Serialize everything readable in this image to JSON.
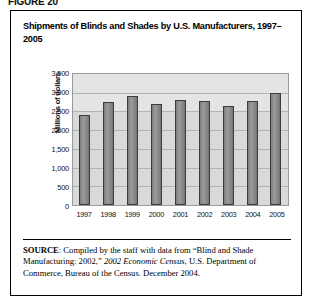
{
  "figure": {
    "label": "FIGURE 20",
    "title": "Shipments of Blinds and Shades by U.S. Manufacturers, 1997–2005"
  },
  "source": {
    "prefix": "SOURCE",
    "text_before_italic": ": Compiled by the staff with data from “Blind and Shade Manufacturing: 2002,” ",
    "italic": "2002 Economic Census",
    "text_after_italic": ", U.S. Department of Commerce, Bureau of the Census. December 2004."
  },
  "chart_data": {
    "type": "bar",
    "title": "Shipments of Blinds and Shades by U.S. Manufacturers, 1997–2005",
    "xlabel": "",
    "ylabel": "Millions of dollars",
    "categories": [
      "1997",
      "1998",
      "1999",
      "2000",
      "2001",
      "2002",
      "2003",
      "2004",
      "2005"
    ],
    "values": [
      2400,
      2750,
      2900,
      2700,
      2800,
      2780,
      2650,
      2780,
      2980
    ],
    "ylim": [
      0,
      3500
    ],
    "yticks": [
      3500,
      3000,
      2500,
      2000,
      1500,
      1000,
      500,
      0
    ],
    "ytick_labels": [
      "3,500",
      "3,000",
      "2,500",
      "2,000",
      "1,500",
      "1,000",
      "500",
      "0"
    ],
    "grid": true,
    "legend": false,
    "bar_color": "#8c8c8c",
    "bar_edge_color": "#3c3c3c",
    "plot_background": "#d9d9d9"
  }
}
